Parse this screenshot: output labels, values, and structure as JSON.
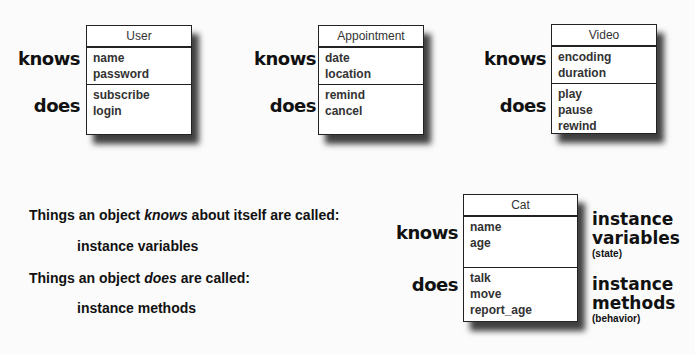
{
  "labels": {
    "knows": "knows",
    "does": "does"
  },
  "classes": [
    {
      "name": "User",
      "knows": [
        "name",
        "password"
      ],
      "does": [
        "subscribe",
        "login"
      ]
    },
    {
      "name": "Appointment",
      "knows": [
        "date",
        "location"
      ],
      "does": [
        "remind",
        "cancel"
      ]
    },
    {
      "name": "Video",
      "knows": [
        "encoding",
        "duration"
      ],
      "does": [
        "play",
        "pause",
        "rewind"
      ]
    },
    {
      "name": "Cat",
      "knows": [
        "name",
        "age"
      ],
      "does": [
        "talk",
        "move",
        "report_age"
      ]
    }
  ],
  "explanation": {
    "line1_pre": "Things an object ",
    "line1_em": "knows",
    "line1_post": " about itself are called:",
    "line2": "instance variables",
    "line3_pre": "Things an object ",
    "line3_em": "does",
    "line3_post": " are called:",
    "line4": "instance methods"
  },
  "cat_annotations": {
    "vars_line1": "instance",
    "vars_line2": "variables",
    "vars_note": "(state)",
    "methods_line1": "instance",
    "methods_line2": "methods",
    "methods_note": "(behavior)"
  }
}
